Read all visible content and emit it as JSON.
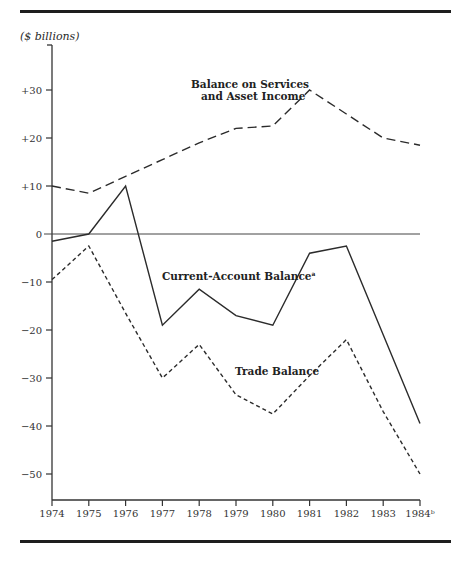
{
  "chart_data": {
    "type": "line",
    "title": "",
    "units_label": "($ billions)",
    "xlabel": "",
    "ylabel": "($ billions)",
    "x": [
      "1974",
      "1975",
      "1976",
      "1977",
      "1978",
      "1979",
      "1980",
      "1981",
      "1982",
      "1983",
      "1984"
    ],
    "x_tick_labels": [
      "1974",
      "1975",
      "1976",
      "1977",
      "1978",
      "1979",
      "1980",
      "1981",
      "1982",
      "1983",
      "1984ᵇ"
    ],
    "y_ticks": [
      30,
      20,
      10,
      0,
      -10,
      -20,
      -30,
      -40,
      -50
    ],
    "y_tick_labels": [
      "+30",
      "+20",
      "+10",
      "0",
      "−10",
      "−20",
      "−30",
      "−40",
      "−50"
    ],
    "ylim": [
      -58,
      37
    ],
    "grid": false,
    "zero_line": true,
    "series": [
      {
        "name": "Balance on Services and Asset Income",
        "style": "long-dash",
        "values": [
          10,
          8.5,
          12,
          15.5,
          19,
          22,
          22.5,
          30,
          25,
          20,
          18.5
        ]
      },
      {
        "name": "Current-Account Balanceᵃ",
        "style": "solid",
        "values": [
          -1.5,
          0,
          10,
          -19,
          -11.5,
          -17,
          -19,
          -4,
          -2.5,
          -21,
          -39.5
        ]
      },
      {
        "name": "Trade Balance",
        "style": "short-dash",
        "values": [
          -9.5,
          -2.5,
          -16.5,
          -30,
          -23,
          -33.5,
          -37.5,
          -29.5,
          -22,
          -37,
          -50
        ]
      }
    ],
    "annotations": [
      {
        "text_line1": "Balance on Services",
        "text_line2": "and Asset Income"
      },
      {
        "text": "Current-Account Balance",
        "superscript": "a"
      },
      {
        "text": "Trade Balance"
      }
    ]
  }
}
